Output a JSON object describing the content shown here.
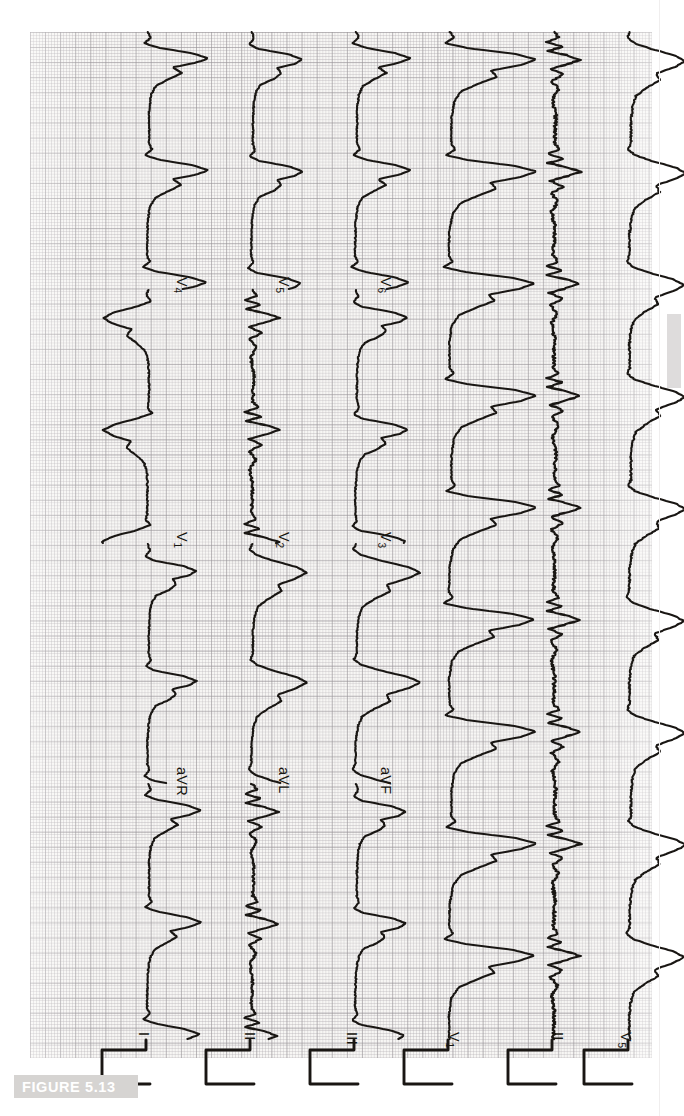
{
  "figure": {
    "caption_label": "FIGURE 5.13",
    "caption_band_color": "#d6d4d2",
    "caption_text_color": "#ffffff"
  },
  "recording": {
    "type": "12-lead electrocardiogram",
    "paper_color": "#f7f6f4",
    "trace_color": "#191613",
    "grid_minor_mm_px": 3.02,
    "grid_major_mm_px": 15.1,
    "orientation": "rotated-90",
    "columns": 6,
    "rows_per_column": 3,
    "calibration_pulse": true
  },
  "leads": {
    "column_1": [
      {
        "id": "I",
        "label": "I",
        "sub": ""
      },
      {
        "id": "aVR",
        "label": "aVR",
        "sub": ""
      },
      {
        "id": "V1",
        "label": "V",
        "sub": "1"
      },
      {
        "id": "V4",
        "label": "V",
        "sub": "4"
      }
    ],
    "column_2": [
      {
        "id": "II",
        "label": "II",
        "sub": ""
      },
      {
        "id": "aVL",
        "label": "aVL",
        "sub": ""
      },
      {
        "id": "V2",
        "label": "V",
        "sub": "2"
      },
      {
        "id": "V5",
        "label": "V",
        "sub": "5"
      }
    ],
    "column_3": [
      {
        "id": "III",
        "label": "III",
        "sub": ""
      },
      {
        "id": "aVF",
        "label": "aVF",
        "sub": ""
      },
      {
        "id": "V3",
        "label": "V",
        "sub": "3"
      },
      {
        "id": "V6",
        "label": "V",
        "sub": "6"
      }
    ],
    "rhythm_strips": [
      {
        "id": "V1-rhythm",
        "label": "V",
        "sub": "1"
      },
      {
        "id": "II-rhythm",
        "label": "II",
        "sub": ""
      },
      {
        "id": "V5-rhythm",
        "label": "V",
        "sub": "5"
      }
    ]
  },
  "chart_data": {
    "type": "line",
    "title": "FIGURE 5.13",
    "xlabel": "Time",
    "ylabel": "Voltage (mV)",
    "grid": true,
    "legend": "none",
    "axis_note": "standard ECG paper: 25 mm/s, 10 mm/mV",
    "series": [
      {
        "name": "I",
        "note": "wide QRS, broad slurred upstroke"
      },
      {
        "name": "aVR",
        "note": "predominantly negative deflection"
      },
      {
        "name": "V1",
        "note": "deep negative QS pattern"
      },
      {
        "name": "V4",
        "note": "tall R wave with wide QRS"
      },
      {
        "name": "II",
        "note": "wide QRS complexes"
      },
      {
        "name": "aVL",
        "note": "broad notched complexes"
      },
      {
        "name": "V2",
        "note": "deep S wave"
      },
      {
        "name": "V5",
        "note": "tall broad R wave"
      },
      {
        "name": "III",
        "note": "wide QRS, variable amplitude"
      },
      {
        "name": "aVF",
        "note": "broad positive complexes"
      },
      {
        "name": "V3",
        "note": "transition zone, biphasic"
      },
      {
        "name": "V6",
        "note": "broad R wave"
      },
      {
        "name": "V1-rhythm",
        "note": "continuous rhythm strip, irregular baseline"
      },
      {
        "name": "II-rhythm",
        "note": "continuous rhythm strip, noisy baseline"
      },
      {
        "name": "V5-rhythm",
        "note": "continuous rhythm strip, broad complexes"
      }
    ]
  }
}
